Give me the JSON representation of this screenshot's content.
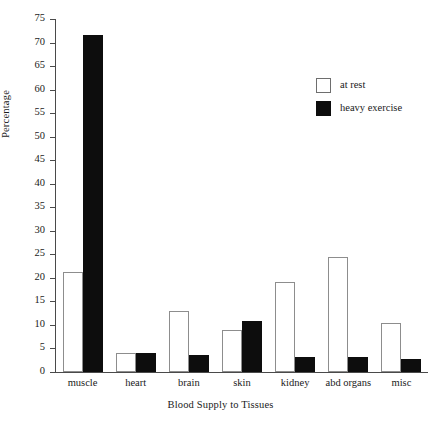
{
  "chart_data": {
    "type": "bar",
    "title": "",
    "xlabel": "Blood Supply to Tissues",
    "ylabel": "Percentage",
    "ylim": [
      0,
      75
    ],
    "ytick_step": 5,
    "grid": false,
    "legend_position": "top-right",
    "categories": [
      "muscle",
      "heart",
      "brain",
      "skin",
      "kidney",
      "abd organs",
      "misc"
    ],
    "series": [
      {
        "name": "at rest",
        "color": "#ffffff",
        "values": [
          21.3,
          4.0,
          13.0,
          8.9,
          19.2,
          24.4,
          10.5
        ]
      },
      {
        "name": "heavy exercise",
        "color": "#0d0d0d",
        "values": [
          71.5,
          4.0,
          3.7,
          10.8,
          3.1,
          3.1,
          2.8
        ]
      }
    ],
    "yticks": [
      0,
      5,
      10,
      15,
      20,
      25,
      30,
      35,
      40,
      45,
      50,
      55,
      60,
      65,
      70,
      75
    ]
  },
  "axis": {
    "y_title": "Percentage",
    "x_title": "Blood Supply to Tissues"
  },
  "legend": {
    "items": [
      {
        "label": "at rest",
        "swatch": "open-square-swatch"
      },
      {
        "label": "heavy exercise",
        "swatch": "filled-square-swatch"
      }
    ]
  }
}
